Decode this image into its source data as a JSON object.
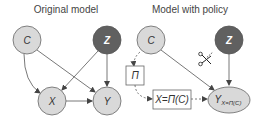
{
  "left_panel": {
    "title": "Original model",
    "nodes": {
      "c": {
        "label": "C"
      },
      "z": {
        "label": "Z"
      },
      "x": {
        "label": "X"
      },
      "y": {
        "label": "Y"
      }
    },
    "edges": [
      "C→X",
      "C→Y",
      "Z→X",
      "Z→Y",
      "X→Y"
    ]
  },
  "right_panel": {
    "title": "Model with policy",
    "nodes": {
      "c": {
        "label": "C"
      },
      "z": {
        "label": "Z"
      },
      "pi": {
        "label": "Π"
      },
      "x_policy": {
        "label": "X=Π(C)"
      },
      "y": {
        "label": "Y",
        "subscript": "X=Π(C)"
      }
    },
    "edges": [
      "C⇢Π (dashed)",
      "Π⇢X=Π(C) (dashed)",
      "X=Π(C)⇢Y (dashed)",
      "C→Y",
      "Z→Y"
    ],
    "cut_edge": "Z→X (scissors)"
  },
  "colors": {
    "light_node": "#d9d9d9",
    "dark_node": "#606060",
    "stroke": "#555555",
    "edge": "#555555"
  }
}
